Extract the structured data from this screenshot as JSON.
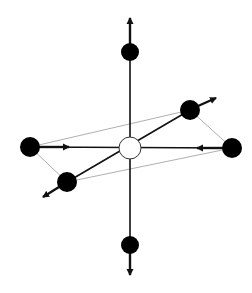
{
  "diagram": {
    "type": "molecular-vibration-mode",
    "colors": {
      "background": "#ffffff",
      "bond": "#111111",
      "outline": "#9a9a9a",
      "atom_fill": "#000000",
      "center_fill": "#ffffff"
    },
    "center_atom": {
      "x": 130,
      "y": 148,
      "r": 11,
      "style": "open"
    },
    "ligands": [
      {
        "id": "top",
        "x": 130,
        "y": 52,
        "r": 9,
        "arrow_to": [
          130,
          16
        ]
      },
      {
        "id": "bottom",
        "x": 130,
        "y": 245,
        "r": 9,
        "arrow_to": [
          130,
          277
        ]
      },
      {
        "id": "left",
        "x": 30,
        "y": 147,
        "r": 10,
        "arrow_to": [
          71,
          147
        ]
      },
      {
        "id": "right",
        "x": 232,
        "y": 148,
        "r": 10,
        "arrow_to": [
          195,
          148
        ]
      },
      {
        "id": "upper-right",
        "x": 190,
        "y": 110,
        "r": 10,
        "arrow_to": [
          218,
          97
        ]
      },
      {
        "id": "lower-left",
        "x": 67,
        "y": 182,
        "r": 10,
        "arrow_to": [
          41,
          198
        ]
      }
    ]
  }
}
